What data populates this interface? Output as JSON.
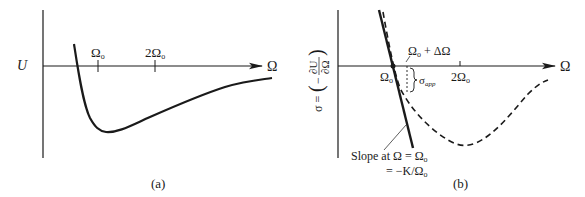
{
  "figure": {
    "panel_a": {
      "caption": "(a)",
      "y_label": "U",
      "x_label": "Ω",
      "ticks": [
        {
          "label": "Ω",
          "sub": "o"
        },
        {
          "label": "2Ω",
          "sub": "o"
        }
      ],
      "curve": "potential energy U vs Ω: steep descent, minimum near Ω_o, slow rise toward zero"
    },
    "panel_b": {
      "caption": "(b)",
      "y_label": "σ = (−∂U/∂Ω)",
      "y_label_parts": {
        "sigma": "σ =",
        "minus": "−",
        "num": "∂U",
        "den": "∂Ω"
      },
      "x_label": "Ω",
      "origin_tick": {
        "label": "Ω",
        "sub": "o"
      },
      "tick_2": {
        "label": "2Ω",
        "sub": "o"
      },
      "delta_label": {
        "label": "Ω",
        "sub": "o",
        "rest": " + ΔΩ"
      },
      "sigma_app": {
        "label": "σ",
        "sub": "app"
      },
      "slope_note": {
        "line1": "Slope at Ω = Ω",
        "line1_sub": "o",
        "line2": "= −K/Ω",
        "line2_sub": "o"
      },
      "curves": [
        "solid tangent line (slope −K/Ω_o)",
        "dashed σ curve"
      ]
    }
  },
  "colors": {
    "ink": "#1a1a1a",
    "background": "#ffffff"
  }
}
